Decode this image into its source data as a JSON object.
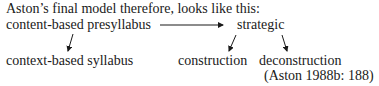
{
  "intro": "Aston’s final model therefore, looks like this:",
  "diagram": {
    "nodes": {
      "content_presyllabus": "content-based  presyllabus",
      "strategic": "strategic",
      "context_syllabus": "context-based  syllabus",
      "construction": "construction",
      "deconstruction": "deconstruction"
    },
    "edges": [
      {
        "from": "content-based presyllabus",
        "to": "strategic"
      },
      {
        "from": "content-based presyllabus",
        "to": "context-based syllabus"
      },
      {
        "from": "strategic",
        "to": "construction"
      },
      {
        "from": "strategic",
        "to": "deconstruction"
      }
    ]
  },
  "citation": "(Aston  1988b:  188)"
}
